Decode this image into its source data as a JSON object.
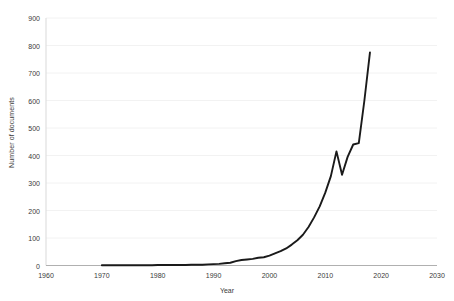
{
  "chart_data": {
    "type": "line",
    "title": "",
    "xlabel": "Year",
    "ylabel": "Number of documents",
    "xlim": [
      1960,
      2030
    ],
    "ylim": [
      0,
      900
    ],
    "grid": true,
    "legend": null,
    "line_color": "#1a1a1a",
    "x_ticks": [
      1960,
      1970,
      1980,
      1990,
      2000,
      2010,
      2020,
      2030
    ],
    "y_ticks": [
      0,
      100,
      200,
      300,
      400,
      500,
      600,
      700,
      800,
      900
    ],
    "x": [
      1970,
      1971,
      1972,
      1973,
      1974,
      1975,
      1976,
      1977,
      1978,
      1979,
      1980,
      1981,
      1982,
      1983,
      1984,
      1985,
      1986,
      1987,
      1988,
      1989,
      1990,
      1991,
      1992,
      1993,
      1994,
      1995,
      1996,
      1997,
      1998,
      1999,
      2000,
      2001,
      2002,
      2003,
      2004,
      2005,
      2006,
      2007,
      2008,
      2009,
      2010,
      2011,
      2012,
      2013,
      2014,
      2015,
      2016,
      2017,
      2018
    ],
    "values": [
      1,
      1,
      1,
      1,
      1,
      1,
      1,
      1,
      1,
      1,
      2,
      2,
      2,
      2,
      2,
      2,
      3,
      3,
      3,
      4,
      5,
      6,
      8,
      10,
      16,
      20,
      22,
      24,
      28,
      30,
      36,
      44,
      52,
      62,
      76,
      92,
      112,
      140,
      175,
      215,
      265,
      325,
      415,
      330,
      395,
      440,
      445,
      600,
      775
    ]
  },
  "axis": {
    "y_labels": [
      "0",
      "100",
      "200",
      "300",
      "400",
      "500",
      "600",
      "700",
      "800",
      "900"
    ],
    "x_labels": [
      "1960",
      "1970",
      "1980",
      "1990",
      "2000",
      "2010",
      "2020",
      "2030"
    ],
    "x_title": "Year",
    "y_title": "Number of documents"
  }
}
